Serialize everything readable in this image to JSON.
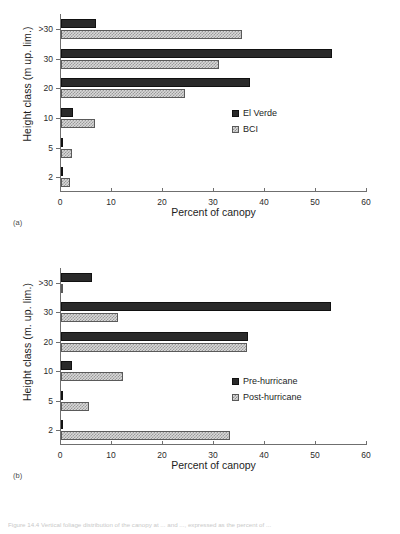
{
  "figure": {
    "panels": [
      {
        "tag": "(a)",
        "ylabel": "Height class (m up. lim.)",
        "xlabel": "Percent of canopy"
      },
      {
        "tag": "(b)",
        "ylabel": "Height class (m. up. lim.)",
        "xlabel": "Percent of canopy"
      }
    ],
    "caption_fragment": "Figure 14.4  Vertical foliage distribution of the canopy at ... and ..., expressed as the percent of ..."
  },
  "chart_data": [
    {
      "type": "bar",
      "orientation": "horizontal",
      "title": "(a)",
      "xlabel": "Percent of canopy",
      "ylabel": "Height class (m up. lim.)",
      "categories": [
        ">30",
        "30",
        "20",
        "10",
        "5",
        "2"
      ],
      "xlim": [
        0,
        60
      ],
      "xticks": [
        0,
        10,
        20,
        30,
        40,
        50,
        60
      ],
      "grid": false,
      "legend_position": "center-right",
      "series": [
        {
          "name": "El Verde",
          "fill": "solid-black",
          "color": "#2a2a2a",
          "values": [
            6.8,
            53.1,
            37.1,
            2.4,
            0.4,
            0.3
          ]
        },
        {
          "name": "BCI",
          "fill": "hatched-grey",
          "color": "#d8d8d8",
          "values": [
            35.5,
            30.9,
            24.3,
            6.7,
            2.1,
            1.7
          ]
        }
      ]
    },
    {
      "type": "bar",
      "orientation": "horizontal",
      "title": "(b)",
      "xlabel": "Percent of canopy",
      "ylabel": "Height class (m. up. lim.)",
      "categories": [
        ">30",
        "30",
        "20",
        "10",
        "5",
        "2"
      ],
      "xlim": [
        0,
        60
      ],
      "xticks": [
        0,
        10,
        20,
        30,
        40,
        50,
        60
      ],
      "grid": false,
      "legend_position": "center-right",
      "series": [
        {
          "name": "Pre-hurricane",
          "fill": "solid-black",
          "color": "#2a2a2a",
          "values": [
            6.1,
            53.0,
            36.7,
            2.2,
            0.3,
            0.3
          ]
        },
        {
          "name": "Post-hurricane",
          "fill": "hatched-grey",
          "color": "#d8d8d8",
          "values": [
            0.15,
            11.1,
            36.5,
            12.2,
            5.5,
            33.2
          ]
        }
      ]
    }
  ]
}
